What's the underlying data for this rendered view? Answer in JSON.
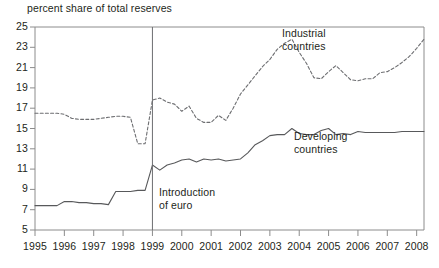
{
  "chart_data": {
    "type": "line",
    "title": "percent share of total reserves",
    "xlabel": "",
    "ylabel": "percent share of total reserves",
    "xlim": [
      1995.0,
      2008.25
    ],
    "ylim": [
      5,
      25
    ],
    "yticks": [
      5,
      7,
      9,
      11,
      13,
      15,
      17,
      19,
      21,
      23,
      25
    ],
    "xticks": [
      1995,
      1996,
      1997,
      1998,
      1999,
      2000,
      2001,
      2002,
      2003,
      2004,
      2005,
      2006,
      2007,
      2008
    ],
    "xtick_labels": [
      "1995",
      "1996",
      "1997",
      "1998",
      "1999",
      "2000",
      "2001",
      "2002",
      "2003",
      "2004",
      "2005",
      "2006",
      "2007",
      "2008"
    ],
    "ytick_labels": [
      "5",
      "7",
      "9",
      "11",
      "13",
      "15",
      "17",
      "19",
      "21",
      "23",
      "25"
    ],
    "grid": false,
    "legend_position": "inline-annotation",
    "annotations": [
      {
        "name": "euro-introduction",
        "text_line1": "Introduction",
        "text_line2": "of euro",
        "x": 1999.0,
        "type": "vertical-line"
      }
    ],
    "series": [
      {
        "name": "Industrial countries",
        "style": "dashed",
        "color": "#6d6e71",
        "label_line1": "Industrial",
        "label_line2": "countries",
        "x": [
          1995.0,
          1995.25,
          1995.5,
          1995.75,
          1996.0,
          1996.25,
          1996.5,
          1996.75,
          1997.0,
          1997.25,
          1997.5,
          1997.75,
          1998.0,
          1998.25,
          1998.5,
          1998.75,
          1999.0,
          1999.25,
          1999.5,
          1999.75,
          2000.0,
          2000.25,
          2000.5,
          2000.75,
          2001.0,
          2001.25,
          2001.5,
          2001.75,
          2002.0,
          2002.25,
          2002.5,
          2002.75,
          2003.0,
          2003.25,
          2003.5,
          2003.75,
          2004.0,
          2004.25,
          2004.5,
          2004.75,
          2005.0,
          2005.25,
          2005.5,
          2005.75,
          2006.0,
          2006.25,
          2006.5,
          2006.75,
          2007.0,
          2007.25,
          2007.5,
          2007.75,
          2008.0,
          2008.25
        ],
        "values": [
          16.5,
          16.5,
          16.5,
          16.5,
          16.4,
          16.0,
          15.9,
          15.9,
          15.9,
          16.0,
          16.1,
          16.2,
          16.2,
          16.1,
          13.5,
          13.5,
          17.8,
          18.0,
          17.6,
          17.4,
          16.7,
          17.2,
          16.0,
          15.6,
          15.6,
          16.3,
          15.8,
          17.0,
          18.4,
          19.3,
          20.2,
          21.1,
          21.8,
          22.8,
          23.4,
          23.8,
          22.5,
          21.4,
          20.0,
          19.9,
          20.6,
          21.2,
          20.5,
          19.8,
          19.7,
          19.9,
          19.9,
          20.5,
          20.6,
          21.0,
          21.5,
          22.1,
          22.9,
          23.8
        ]
      },
      {
        "name": "Developing countries",
        "style": "solid",
        "color": "#58595b",
        "label_line1": "Developing",
        "label_line2": "countries",
        "x": [
          1995.0,
          1995.25,
          1995.5,
          1995.75,
          1996.0,
          1996.25,
          1996.5,
          1996.75,
          1997.0,
          1997.25,
          1997.5,
          1997.75,
          1998.0,
          1998.25,
          1998.5,
          1998.75,
          1999.0,
          1999.25,
          1999.5,
          1999.75,
          2000.0,
          2000.25,
          2000.5,
          2000.75,
          2001.0,
          2001.25,
          2001.5,
          2001.75,
          2002.0,
          2002.25,
          2002.5,
          2002.75,
          2003.0,
          2003.25,
          2003.5,
          2003.75,
          2004.0,
          2004.25,
          2004.5,
          2004.75,
          2005.0,
          2005.25,
          2005.5,
          2005.75,
          2006.0,
          2006.25,
          2006.5,
          2006.75,
          2007.0,
          2007.25,
          2007.5,
          2007.75,
          2008.0,
          2008.25
        ],
        "values": [
          7.4,
          7.4,
          7.4,
          7.4,
          7.8,
          7.8,
          7.7,
          7.7,
          7.6,
          7.6,
          7.5,
          8.8,
          8.8,
          8.8,
          8.9,
          8.9,
          11.4,
          10.9,
          11.4,
          11.6,
          11.9,
          12.0,
          11.7,
          12.0,
          11.9,
          12.0,
          11.8,
          11.9,
          12.0,
          12.6,
          13.4,
          13.8,
          14.3,
          14.4,
          14.4,
          15.0,
          14.5,
          14.4,
          14.4,
          14.8,
          15.0,
          14.4,
          14.5,
          14.4,
          14.7,
          14.6,
          14.6,
          14.6,
          14.6,
          14.6,
          14.7,
          14.7,
          14.7,
          14.7
        ]
      }
    ]
  },
  "axes": {
    "plot_left": 35,
    "plot_right": 424,
    "plot_top": 27,
    "plot_bottom": 230
  },
  "colors": {
    "text": "#231f20",
    "axis": "#8c8c8c",
    "industrial": "#6d6e71",
    "developing": "#58595b"
  }
}
